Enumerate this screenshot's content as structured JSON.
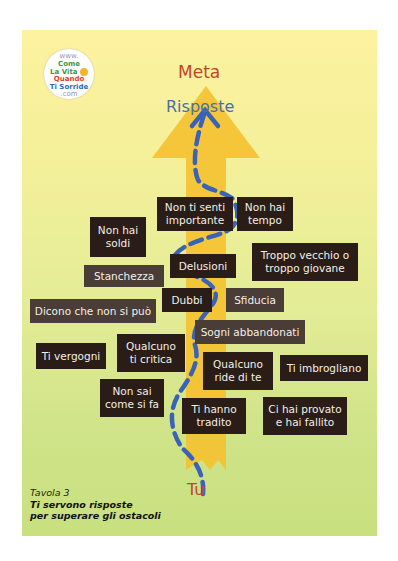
{
  "logo": {
    "line1": "www.",
    "line2": "Come",
    "line3": "La Vita",
    "line4": "Quando",
    "line5": "Ti Sorride",
    "line6": ".com"
  },
  "diagram": {
    "top_label": "Meta",
    "arrow_label": "Risposte",
    "bottom_label": "Tu",
    "colors": {
      "background_top": "#fdf29f",
      "background_bottom": "#c9e07f",
      "arrow": "#f4c231",
      "path": "#3a63b8",
      "box": "#2a1d17",
      "label_red": "#c0452a",
      "label_blue": "#4a6fa8"
    },
    "obstacles": [
      {
        "text": "Non ti senti importante"
      },
      {
        "text": "Non hai tempo"
      },
      {
        "text": "Non hai soldi"
      },
      {
        "text": "Troppo vecchio o troppo giovane"
      },
      {
        "text": "Delusioni"
      },
      {
        "text": "Stanchezza"
      },
      {
        "text": "Dubbi"
      },
      {
        "text": "Sfiducia"
      },
      {
        "text": "Dicono che non si può"
      },
      {
        "text": "Sogni abbandonati"
      },
      {
        "text": "Qualcuno ti critica"
      },
      {
        "text": "Ti vergogni"
      },
      {
        "text": "Qualcuno ride di te"
      },
      {
        "text": "Ti imbrogliano"
      },
      {
        "text": "Non sai come si fa"
      },
      {
        "text": "Ti hanno tradito"
      },
      {
        "text": "Ci hai provato e hai fallito"
      }
    ]
  },
  "caption": {
    "label": "Tavola 3",
    "title_line1": "Ti servono risposte",
    "title_line2": "per superare gli ostacoli"
  }
}
